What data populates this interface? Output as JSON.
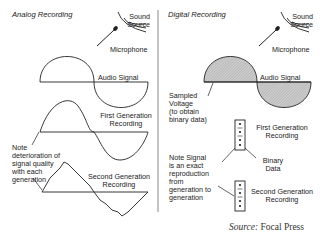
{
  "analog": {
    "title": "Analog Recording",
    "sound_source": [
      "Sound",
      "Source"
    ],
    "microphone": "Microphone",
    "audio_signal": "Audio Signal",
    "first_gen": [
      "First Generation",
      "Recording"
    ],
    "note": [
      "Note",
      "deterioration of",
      "signal quality",
      "with each",
      "generation"
    ],
    "second_gen": [
      "Second Generation",
      "Recording"
    ]
  },
  "digital": {
    "title": "Digital Recording",
    "sound_source": [
      "Sound",
      "Source"
    ],
    "microphone": "Microphone",
    "audio_signal": "Audio Signal",
    "sampled": [
      "Sampled",
      "Voltage",
      "(to obtain",
      "binary data)"
    ],
    "first_gen": [
      "First Generation",
      "Recording"
    ],
    "note": [
      "Note Signal",
      "is an exact",
      "reproduction",
      "from",
      "generation to",
      "generation"
    ],
    "binary_data": [
      "Binary",
      "Data"
    ],
    "second_gen": [
      "Second Generation",
      "Recording"
    ]
  },
  "source": {
    "prefix": "Source:",
    "name": " Focal Press"
  },
  "colors": {
    "line": "#222222",
    "divider": "#888888",
    "hatch": "#bdbdbd"
  }
}
